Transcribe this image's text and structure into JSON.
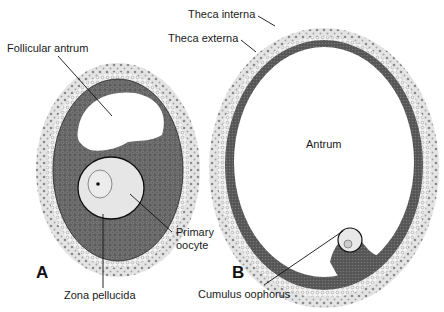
{
  "figure": {
    "panels": [
      {
        "id": "A",
        "label": "A",
        "description": "Secondary (antral) follicle"
      },
      {
        "id": "B",
        "label": "B",
        "description": "Mature (Graafian) follicle"
      }
    ],
    "labels": {
      "follicular_antrum": "Follicular antrum",
      "primary_oocyte_line1": "Primary",
      "primary_oocyte_line2": "oocyte",
      "zona_pellucida": "Zona pellucida",
      "theca_interna": "Theca interna",
      "theca_externa": "Theca externa",
      "antrum": "Antrum",
      "cumulus_oophorus": "Cumulus oophorus"
    },
    "colors": {
      "theca": "#d9d9d9",
      "theca_dots": "#8a8a8a",
      "granulosa": "#6b6b6b",
      "oocyte": "#e6e6e6",
      "leader": "#111111"
    }
  }
}
